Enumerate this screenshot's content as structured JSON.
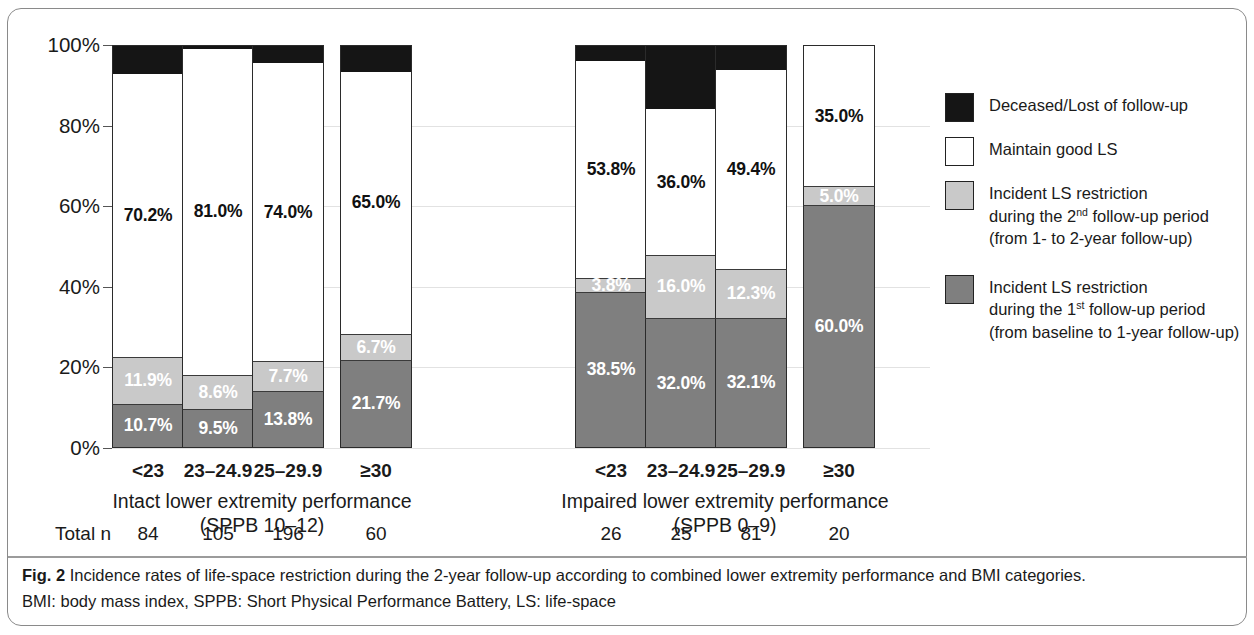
{
  "chart_data": {
    "type": "bar",
    "subtype": "stacked-100-percent",
    "title": "",
    "xlabel": "",
    "ylabel": "",
    "ylim": [
      0,
      100
    ],
    "ytick_labels": [
      "0%",
      "20%",
      "40%",
      "60%",
      "80%",
      "100%"
    ],
    "ytick_values": [
      0,
      20,
      40,
      60,
      80,
      100
    ],
    "grid": true,
    "legend_position": "right",
    "categories": [
      "<23",
      "23–24.9",
      "25–29.9",
      "≥30",
      "<23",
      "23–24.9",
      "25–29.9",
      "≥30"
    ],
    "series": [
      {
        "name": "Incident LS restriction during the 1st follow-up period (from baseline to 1-year follow-up)",
        "color": "#7f7f7f",
        "values": [
          10.7,
          9.5,
          13.8,
          21.7,
          38.5,
          32.0,
          32.1,
          60.0
        ],
        "labels": [
          "10.7%",
          "9.5%",
          "13.8%",
          "21.7%",
          "38.5%",
          "32.0%",
          "32.1%",
          "60.0%"
        ]
      },
      {
        "name": "Incident LS restriction during the 2nd follow-up period (from 1- to 2-year follow-up)",
        "color": "#c9c9c9",
        "values": [
          11.9,
          8.6,
          7.7,
          6.7,
          3.8,
          16.0,
          12.3,
          5.0
        ],
        "labels": [
          "11.9%",
          "8.6%",
          "7.7%",
          "6.7%",
          "3.8%",
          "16.0%",
          "12.3%",
          "5.0%"
        ]
      },
      {
        "name": "Maintain good LS",
        "color": "#ffffff",
        "values": [
          70.2,
          81.0,
          74.0,
          65.0,
          53.8,
          36.0,
          49.4,
          35.0
        ],
        "labels": [
          "70.2%",
          "81.0%",
          "74.0%",
          "65.0%",
          "53.8%",
          "36.0%",
          "49.4%",
          "35.0%"
        ]
      },
      {
        "name": "Deceased/Lost of follow-up",
        "color": "#151515",
        "values": [
          7.2,
          0.9,
          4.5,
          6.6,
          3.9,
          16.0,
          6.2,
          0.0
        ],
        "labels": [
          "",
          "",
          "",
          "",
          "",
          "",
          "",
          ""
        ]
      }
    ],
    "group_totals": [
      84,
      105,
      196,
      60,
      26,
      25,
      81,
      20
    ]
  },
  "axis": {
    "ticks": [
      {
        "label": "100%",
        "value": 100
      },
      {
        "label": "80%",
        "value": 80
      },
      {
        "label": "60%",
        "value": 60
      },
      {
        "label": "40%",
        "value": 40
      },
      {
        "label": "20%",
        "value": 20
      },
      {
        "label": "0%",
        "value": 0
      }
    ]
  },
  "groups": [
    {
      "title": "Intact lower extremity performance",
      "subtitle": "(SPPB 10–12)",
      "bars": [
        {
          "category": "<23",
          "total_n": "84",
          "black": 7.2,
          "white": 70.2,
          "lgray": 11.9,
          "dgray": 10.7,
          "white_label": "70.2%",
          "lgray_label": "11.9%",
          "dgray_label": "10.7%"
        },
        {
          "category": "23–24.9",
          "total_n": "105",
          "black": 0.9,
          "white": 81.0,
          "lgray": 8.6,
          "dgray": 9.5,
          "white_label": "81.0%",
          "lgray_label": "8.6%",
          "dgray_label": "9.5%"
        },
        {
          "category": "25–29.9",
          "total_n": "196",
          "black": 4.5,
          "white": 74.0,
          "lgray": 7.7,
          "dgray": 13.8,
          "white_label": "74.0%",
          "lgray_label": "7.7%",
          "dgray_label": "13.8%"
        },
        {
          "category": "≥30",
          "total_n": "60",
          "black": 6.6,
          "white": 65.0,
          "lgray": 6.7,
          "dgray": 21.7,
          "white_label": "65.0%",
          "lgray_label": "6.7%",
          "dgray_label": "21.7%"
        }
      ]
    },
    {
      "title": "Impaired lower extremity performance",
      "subtitle": "(SPPB 0–9)",
      "bars": [
        {
          "category": "<23",
          "total_n": "26",
          "black": 3.9,
          "white": 53.8,
          "lgray": 3.8,
          "dgray": 38.5,
          "white_label": "53.8%",
          "lgray_label": "3.8%",
          "dgray_label": "38.5%"
        },
        {
          "category": "23–24.9",
          "total_n": "25",
          "black": 16.0,
          "white": 36.0,
          "lgray": 16.0,
          "dgray": 32.0,
          "white_label": "36.0%",
          "lgray_label": "16.0%",
          "dgray_label": "32.0%"
        },
        {
          "category": "25–29.9",
          "total_n": "81",
          "black": 6.2,
          "white": 49.4,
          "lgray": 12.3,
          "dgray": 32.1,
          "white_label": "49.4%",
          "lgray_label": "12.3%",
          "dgray_label": "32.1%"
        },
        {
          "category": "≥30",
          "total_n": "20",
          "black": 0.0,
          "white": 35.0,
          "lgray": 5.0,
          "dgray": 60.0,
          "white_label": "35.0%",
          "lgray_label": "5.0%",
          "dgray_label": "60.0%"
        }
      ]
    }
  ],
  "totals_row": {
    "label": "Total n",
    "values": [
      "84",
      "105",
      "196",
      "60",
      "26",
      "25",
      "81",
      "20"
    ]
  },
  "legend": {
    "items": [
      {
        "swatch": "black",
        "line1": "Deceased/Lost of follow-up",
        "line2": "",
        "line3": "",
        "sup": ""
      },
      {
        "swatch": "white",
        "line1": "Maintain good LS",
        "line2": "",
        "line3": "",
        "sup": ""
      },
      {
        "swatch": "lgray",
        "line1": "Incident LS restriction",
        "line2a": "during the 2",
        "sup": "nd",
        "line2b": " follow-up period",
        "line3": "(from 1- to 2-year follow-up)"
      },
      {
        "swatch": "dgray",
        "line1": "Incident LS restriction",
        "line2a": "during the 1",
        "sup": "st",
        "line2b": " follow-up period",
        "line3": "(from baseline to 1-year follow-up)"
      }
    ]
  },
  "caption": {
    "figure_number": "Fig. 2",
    "text": " Incidence rates of life-space restriction during the 2-year follow-up according to combined lower extremity performance and BMI categories.",
    "abbreviations": "BMI: body mass index, SPPB: Short Physical Performance Battery, LS: life-space"
  },
  "colors": {
    "black": "#151515",
    "white": "#ffffff",
    "light_gray": "#c9c9c9",
    "dark_gray": "#7f7f7f",
    "frame": "#8a8a8a",
    "gridline": "#e2e2e2"
  }
}
